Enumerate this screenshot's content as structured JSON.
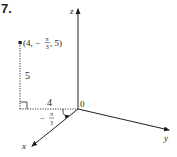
{
  "problem": {
    "number": "7."
  },
  "axes": {
    "z_label": "z",
    "y_label": "y",
    "x_label": "x",
    "origin_label": "0"
  },
  "point": {
    "label_open": "(4, −",
    "label_pi": "π",
    "label_3": "3",
    "label_close": ", 5)"
  },
  "dimensions": {
    "height_label": "5",
    "radius_label": "4",
    "angle_sign": "−",
    "angle_num": "π",
    "angle_den": "3"
  },
  "colors": {
    "ink": "#231f20",
    "background": "#ffffff"
  }
}
